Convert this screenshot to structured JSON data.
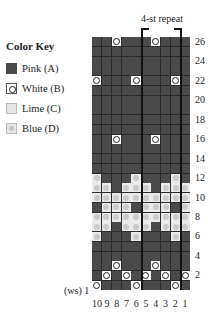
{
  "key": {
    "title": "Color Key",
    "items": [
      {
        "code": "A",
        "label": "Pink (A)",
        "symbol": "dark-square"
      },
      {
        "code": "B",
        "label": "White (B)",
        "symbol": "open-circle"
      },
      {
        "code": "C",
        "label": "Lime (C)",
        "symbol": "light-square"
      },
      {
        "code": "D",
        "label": "Blue (D)",
        "symbol": "light-square-gray-dot"
      }
    ]
  },
  "chart": {
    "repeat_label": "4-st repeat",
    "ws_label": "(ws) 1",
    "columns": [
      "10",
      "9",
      "8",
      "7",
      "6",
      "5",
      "4",
      "3",
      "2",
      "1"
    ],
    "row_labels": [
      "26",
      "24",
      "22",
      "20",
      "18",
      "16",
      "14",
      "12",
      "10",
      "8",
      "6",
      "4",
      "2"
    ],
    "rows_top_to_bottom": {
      "26": "AABAAABAAA",
      "25": "AAAAAAAAAA",
      "24": "AAAAAAAAAA",
      "23": "AAAAAAAAAA",
      "22": "BAAABAAABA",
      "21": "AAAAAAAAAA",
      "20": "AAAAAAAAAA",
      "19": "AAAAAAAAAA",
      "18": "AAAAAAAAAA",
      "17": "AAAAAAAAAA",
      "16": "AABAAABAAA",
      "15": "AAAAAAAAAA",
      "14": "AAAAAAAAAA",
      "13": "AAAAAAAAAA",
      "12": "DAAADAAADA",
      "11": "DDADDDADDD",
      "10": "DDDDDDDDDD",
      "9": "ADDDADDDAD",
      "8": "DDDDDDDDDD",
      "7": "DDADDDADDD",
      "6": "DAAADAAADA",
      "5": "AAAAAAAAAA",
      "4": "AAAAAAAAAA",
      "3": "AABAAABAAA",
      "2": "ABABABABAB",
      "1": "BAAABAAABA"
    },
    "row_order": [
      "26",
      "25",
      "24",
      "23",
      "22",
      "21",
      "20",
      "19",
      "18",
      "17",
      "16",
      "15",
      "14",
      "13",
      "12",
      "11",
      "10",
      "9",
      "8",
      "7",
      "6",
      "5",
      "4",
      "3",
      "2",
      "1"
    ]
  }
}
